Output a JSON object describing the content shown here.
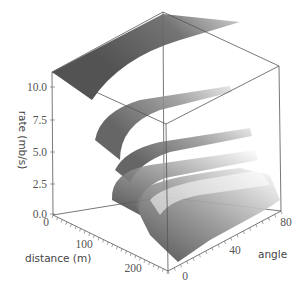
{
  "chart_data": {
    "type": "surface3d",
    "title": "",
    "axes": {
      "x": {
        "label": "distance (m)",
        "ticks": [
          "0",
          "100",
          "200"
        ],
        "range": [
          0,
          250
        ]
      },
      "y": {
        "label": "angle",
        "ticks": [
          "0",
          "40",
          "80"
        ],
        "range": [
          0,
          90
        ]
      },
      "z": {
        "label": "rate (mb/s)",
        "ticks": [
          "0.0",
          "2.5",
          "5.0",
          "7.5",
          "10.0"
        ],
        "range": [
          0,
          11
        ]
      }
    },
    "grid": false,
    "legend": null,
    "colormap": "grayscale (dark at low angle, fading to white at high angle)",
    "surface_levels": [
      {
        "distance_range": [
          0,
          40
        ],
        "rate_approx": 11.0
      },
      {
        "distance_range": [
          60,
          110
        ],
        "rate_approx": 7.8
      },
      {
        "distance_range": [
          110,
          150
        ],
        "rate_approx": 5.5
      },
      {
        "distance_range": [
          140,
          180
        ],
        "rate_approx": 4.5
      },
      {
        "distance_range": [
          160,
          200
        ],
        "rate_approx": 3.8
      },
      {
        "distance_range": [
          180,
          250
        ],
        "rate_approx": 1.5
      }
    ]
  },
  "labels": {
    "zaxis": "rate (mb/s)",
    "xaxis": "distance (m)",
    "yaxis": "angle",
    "zticks": [
      "10.0",
      "7.5",
      "5.0",
      "2.5",
      "0.0"
    ],
    "xticks": [
      "0",
      "100",
      "200"
    ],
    "yticks": [
      "0",
      "40",
      "80"
    ]
  }
}
